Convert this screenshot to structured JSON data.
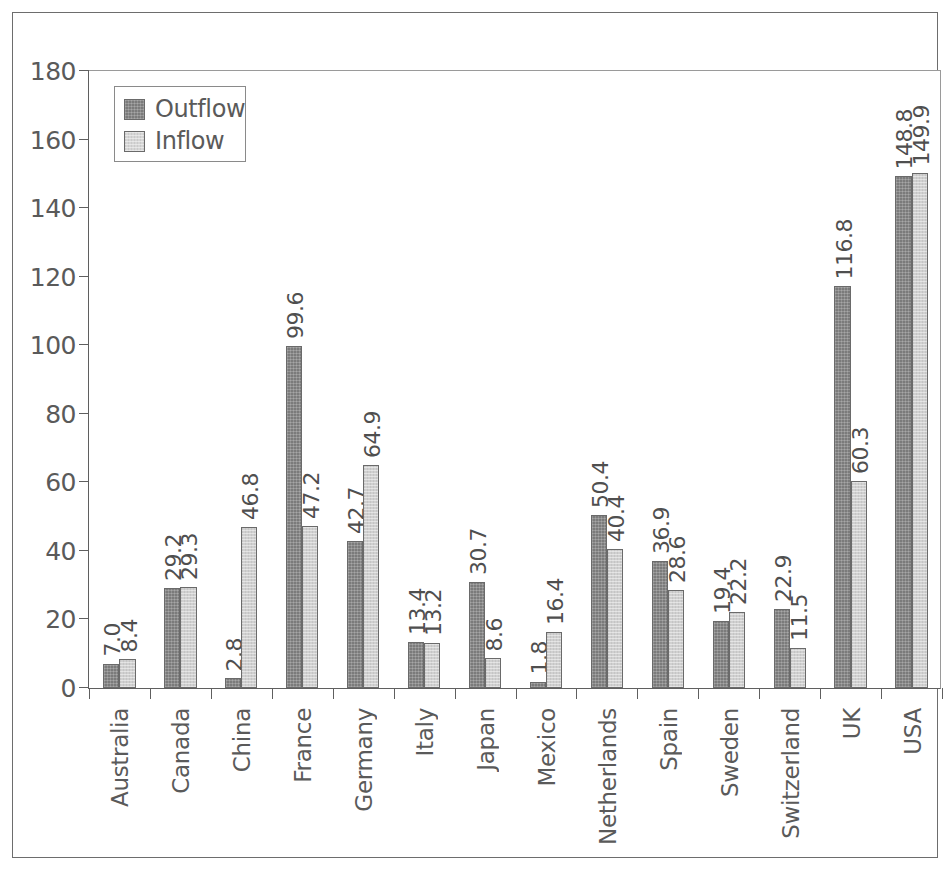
{
  "chart_data": {
    "type": "bar",
    "title": "",
    "subtitle": "",
    "xlabel": "",
    "ylabel": "",
    "ylim": [
      0,
      180
    ],
    "ytick_step": 20,
    "yticks": [
      "0",
      "20",
      "40",
      "60",
      "80",
      "100",
      "120",
      "140",
      "160",
      "180"
    ],
    "grid": false,
    "legend_position": "top-left",
    "categories": [
      "Australia",
      "Canada",
      "China",
      "France",
      "Germany",
      "Italy",
      "Japan",
      "Mexico",
      "Netherlands",
      "Spain",
      "Sweden",
      "Switzerland",
      "UK",
      "USA"
    ],
    "series": [
      {
        "name": "Outflow",
        "color": "#7b7b7b",
        "values": [
          7.0,
          29.2,
          2.8,
          99.6,
          42.7,
          13.4,
          30.7,
          1.8,
          50.4,
          36.9,
          19.4,
          22.9,
          116.8,
          148.8
        ],
        "labels": [
          "7.0",
          "29.2",
          "2.8",
          "99.6",
          "42.7",
          "13.4",
          "30.7",
          "1.8",
          "50.4",
          "36.9",
          "19.4",
          "22.9",
          "116.8",
          "148.8"
        ]
      },
      {
        "name": "Inflow",
        "color": "#d0d0d0",
        "values": [
          8.4,
          29.3,
          46.8,
          47.2,
          64.9,
          13.2,
          8.6,
          16.4,
          40.4,
          28.6,
          22.2,
          11.5,
          60.3,
          149.9
        ],
        "labels": [
          "8.4",
          "29.3",
          "46.8",
          "47.2",
          "64.9",
          "13.2",
          "8.6",
          "16.4",
          "40.4",
          "28.6",
          "22.2",
          "11.5",
          "60.3",
          "149.9"
        ]
      }
    ]
  },
  "legend": {
    "entries": [
      {
        "label": "Outflow"
      },
      {
        "label": "Inflow"
      }
    ]
  },
  "colors": {
    "outflow": "#7b7b7b",
    "inflow": "#d0d0d0",
    "axis": "#5f5f5f",
    "text": "#5a5a5a",
    "frame": "#6d6d6d"
  }
}
